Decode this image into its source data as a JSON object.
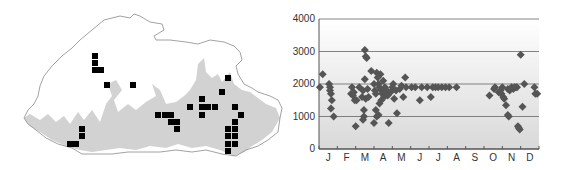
{
  "map": {
    "description": "Bhutan distribution map with occurrence grid squares",
    "outline_color": "#888888",
    "relief_color": "#cfcfcf",
    "marker_color": "#000000",
    "squares": [
      [
        95,
        56
      ],
      [
        95,
        63
      ],
      [
        95,
        70
      ],
      [
        101,
        70
      ],
      [
        107,
        85
      ],
      [
        133,
        85
      ],
      [
        82,
        129
      ],
      [
        82,
        136
      ],
      [
        70,
        144
      ],
      [
        76,
        144
      ],
      [
        158,
        115
      ],
      [
        165,
        115
      ],
      [
        171,
        115
      ],
      [
        171,
        122
      ],
      [
        177,
        122
      ],
      [
        177,
        129
      ],
      [
        190,
        107
      ],
      [
        202,
        99
      ],
      [
        202,
        107
      ],
      [
        208,
        107
      ],
      [
        215,
        107
      ],
      [
        202,
        115
      ],
      [
        222,
        92
      ],
      [
        228,
        78
      ],
      [
        235,
        107
      ],
      [
        241,
        115
      ],
      [
        235,
        122
      ],
      [
        228,
        129
      ],
      [
        235,
        129
      ],
      [
        228,
        136
      ],
      [
        235,
        136
      ],
      [
        228,
        144
      ],
      [
        235,
        144
      ],
      [
        228,
        151
      ]
    ]
  },
  "chart_data": {
    "type": "scatter",
    "title": "",
    "xlabel": "",
    "ylabel": "",
    "ylim": [
      0,
      4000
    ],
    "yticks": [
      "0",
      "1000",
      "2000",
      "3000",
      "4000"
    ],
    "categories": [
      "J",
      "F",
      "M",
      "A",
      "M",
      "J",
      "J",
      "A",
      "S",
      "O",
      "N",
      "D"
    ],
    "grid": true,
    "marker": "diamond",
    "marker_color": "#555555",
    "series": [
      {
        "name": "elevation records",
        "points": [
          [
            0.05,
            1900
          ],
          [
            0.2,
            2300
          ],
          [
            0.55,
            2000
          ],
          [
            0.6,
            1900
          ],
          [
            0.6,
            1800
          ],
          [
            0.65,
            1700
          ],
          [
            0.7,
            1500
          ],
          [
            0.65,
            1250
          ],
          [
            0.8,
            1000
          ],
          [
            1.8,
            1900
          ],
          [
            1.75,
            1700
          ],
          [
            1.85,
            1650
          ],
          [
            1.95,
            1500
          ],
          [
            2.05,
            1500
          ],
          [
            1.9,
            1750
          ],
          [
            2.0,
            700
          ],
          [
            2.2,
            1900
          ],
          [
            2.35,
            1600
          ],
          [
            2.4,
            1800
          ],
          [
            2.5,
            3050
          ],
          [
            2.55,
            2850
          ],
          [
            2.6,
            2800
          ],
          [
            2.5,
            2150
          ],
          [
            2.45,
            1200
          ],
          [
            2.45,
            1000
          ],
          [
            2.4,
            900
          ],
          [
            2.55,
            1550
          ],
          [
            2.65,
            1850
          ],
          [
            2.7,
            1600
          ],
          [
            2.85,
            2400
          ],
          [
            3.0,
            2000
          ],
          [
            3.05,
            1800
          ],
          [
            3.1,
            1700
          ],
          [
            3.15,
            2350
          ],
          [
            3.2,
            2200
          ],
          [
            3.25,
            2000
          ],
          [
            3.3,
            1900
          ],
          [
            3.35,
            2300
          ],
          [
            3.4,
            1800
          ],
          [
            3.45,
            1700
          ],
          [
            3.5,
            2100
          ],
          [
            3.55,
            1600
          ],
          [
            3.0,
            800
          ],
          [
            3.1,
            1200
          ],
          [
            3.15,
            1000
          ],
          [
            3.25,
            1050
          ],
          [
            3.3,
            1400
          ],
          [
            3.4,
            1500
          ],
          [
            3.6,
            1900
          ],
          [
            3.6,
            1750
          ],
          [
            3.7,
            1800
          ],
          [
            3.75,
            1650
          ],
          [
            3.8,
            800
          ],
          [
            3.9,
            1750
          ],
          [
            4.0,
            1900
          ],
          [
            4.05,
            2000
          ],
          [
            4.1,
            1550
          ],
          [
            4.2,
            1800
          ],
          [
            4.25,
            1100
          ],
          [
            4.4,
            1850
          ],
          [
            4.5,
            1950
          ],
          [
            4.6,
            1600
          ],
          [
            4.7,
            2200
          ],
          [
            4.75,
            1900
          ],
          [
            5.05,
            1900
          ],
          [
            5.25,
            1900
          ],
          [
            5.5,
            1500
          ],
          [
            5.6,
            1900
          ],
          [
            5.9,
            1900
          ],
          [
            6.1,
            1600
          ],
          [
            6.2,
            1900
          ],
          [
            6.35,
            1900
          ],
          [
            6.5,
            1900
          ],
          [
            6.7,
            1900
          ],
          [
            6.9,
            1900
          ],
          [
            7.1,
            1900
          ],
          [
            7.5,
            1900
          ],
          [
            9.3,
            1650
          ],
          [
            9.55,
            1850
          ],
          [
            9.6,
            1900
          ],
          [
            9.8,
            1750
          ],
          [
            9.9,
            1800
          ],
          [
            9.95,
            1700
          ],
          [
            10.0,
            1900
          ],
          [
            10.05,
            1600
          ],
          [
            10.1,
            1550
          ],
          [
            10.2,
            1350
          ],
          [
            10.3,
            1050
          ],
          [
            10.35,
            1000
          ],
          [
            10.3,
            1850
          ],
          [
            10.4,
            1800
          ],
          [
            10.5,
            1900
          ],
          [
            10.6,
            1850
          ],
          [
            10.65,
            1900
          ],
          [
            10.75,
            1900
          ],
          [
            10.8,
            1900
          ],
          [
            10.85,
            700
          ],
          [
            10.9,
            650
          ],
          [
            10.95,
            600
          ],
          [
            11.0,
            2900
          ],
          [
            11.1,
            1300
          ],
          [
            11.2,
            2000
          ],
          [
            11.75,
            1900
          ],
          [
            11.8,
            1700
          ],
          [
            11.9,
            1700
          ]
        ]
      }
    ]
  }
}
